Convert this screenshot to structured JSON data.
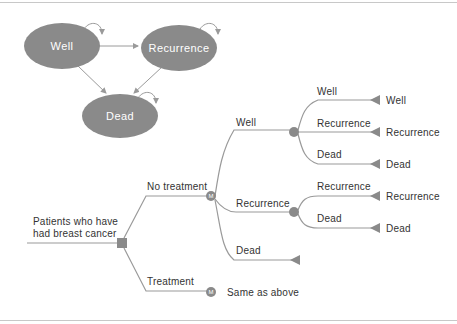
{
  "colors": {
    "node_fill": "#8a8a8a",
    "line": "#9a9a9a",
    "text": "#333333",
    "state_text": "#ffffff"
  },
  "state_diagram": {
    "states": [
      {
        "id": "well",
        "label": "Well"
      },
      {
        "id": "recurrence",
        "label": "Recurrence"
      },
      {
        "id": "dead",
        "label": "Dead"
      }
    ],
    "transitions": [
      {
        "from": "Well",
        "to": "Well"
      },
      {
        "from": "Well",
        "to": "Recurrence"
      },
      {
        "from": "Well",
        "to": "Dead"
      },
      {
        "from": "Recurrence",
        "to": "Recurrence"
      },
      {
        "from": "Recurrence",
        "to": "Dead"
      },
      {
        "from": "Dead",
        "to": "Dead"
      }
    ]
  },
  "decision_tree": {
    "root_label_line1": "Patients who have",
    "root_label_line2": "had breast cancer",
    "no_treatment": {
      "label": "No treatment",
      "node": "M",
      "branches": {
        "well": {
          "label": "Well",
          "outcomes": [
            {
              "branch": "Well",
              "terminal": "Well"
            },
            {
              "branch": "Recurrence",
              "terminal": "Recurrence"
            },
            {
              "branch": "Dead",
              "terminal": "Dead"
            }
          ]
        },
        "recurrence": {
          "label": "Recurrence",
          "outcomes": [
            {
              "branch": "Recurrence",
              "terminal": "Recurrence"
            },
            {
              "branch": "Dead",
              "terminal": "Dead"
            }
          ]
        },
        "dead": {
          "label": "Dead"
        }
      }
    },
    "treatment": {
      "label": "Treatment",
      "node": "M",
      "note": "Same as above"
    }
  }
}
